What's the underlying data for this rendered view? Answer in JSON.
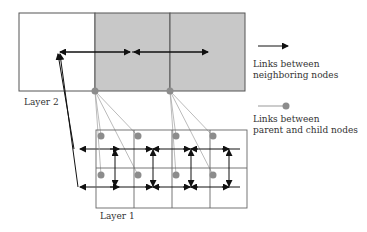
{
  "layers": {
    "layer2": {
      "label": "Layer 2"
    },
    "layer1": {
      "label": "Layer 1"
    }
  },
  "legend": {
    "neighbor_links": {
      "label_line1": "Links between",
      "label_line2": "neighboring nodes",
      "icon": "arrow-right-icon"
    },
    "parent_child_links": {
      "label_line1": "Links between",
      "label_line2": "parent and child nodes",
      "icon": "line-dot-icon"
    }
  },
  "colors": {
    "grid_line": "#555555",
    "shaded_cell": "#c8c8c8",
    "node_dot": "#8c8c8c",
    "parent_child_line": "#aaaaaa",
    "arrow": "#111111",
    "text": "#333333"
  },
  "upper_grid": {
    "x": [
      19,
      95,
      170,
      245
    ],
    "y": [
      13,
      91
    ],
    "shaded_cells": [
      1,
      2
    ]
  },
  "lower_grid": {
    "x": [
      96,
      134,
      172,
      210,
      247
    ],
    "y": [
      130,
      168,
      208
    ]
  }
}
